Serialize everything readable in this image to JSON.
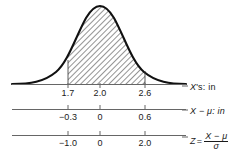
{
  "figure": {
    "type": "normal-distribution-with-shaded-area",
    "curve": {
      "mean_x_px": 100,
      "peak_y_px": 6,
      "baseline_y_px": 84
    },
    "shaded_region": {
      "from": "1.7",
      "to": "2.6",
      "pattern": "diagonal-hatch"
    }
  },
  "axes": [
    {
      "id": "x-axis",
      "label_main": "X",
      "label_prime": "'s: in",
      "label_text": "X's: in",
      "ticks": [
        {
          "value": "1.7",
          "x_px": 68
        },
        {
          "value": "2.0",
          "x_px": 100
        },
        {
          "value": "2.6",
          "x_px": 145
        }
      ]
    },
    {
      "id": "x-minus-mu-axis",
      "label_main": "X",
      "label_rest": " − μ: in",
      "label_text": "X − μ: in",
      "ticks": [
        {
          "value": "−0.3",
          "x_px": 68
        },
        {
          "value": "0",
          "x_px": 100
        },
        {
          "value": "0.6",
          "x_px": 145
        }
      ]
    },
    {
      "id": "z-axis",
      "label_main": "Z",
      "label_eq": "=",
      "label_numerator": "X − μ",
      "label_denominator": "σ",
      "label_text": "Z = (X − μ) / σ",
      "ticks": [
        {
          "value": "−1.0",
          "x_px": 68
        },
        {
          "value": "0",
          "x_px": 100
        },
        {
          "value": "2.0",
          "x_px": 145
        }
      ]
    }
  ],
  "colors": {
    "ink": "#1a1a1a",
    "axis": "#555555",
    "hatch": "#3a3a3a",
    "background": "#ffffff"
  }
}
